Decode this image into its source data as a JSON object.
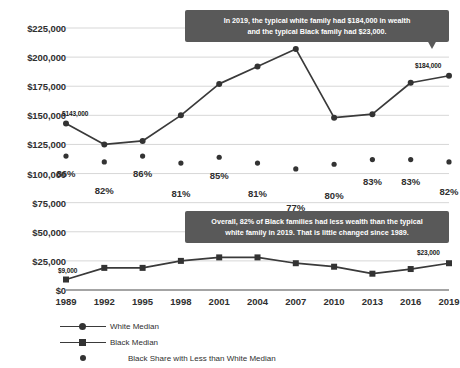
{
  "chart_data": {
    "type": "line",
    "title": "",
    "subtitle": "",
    "xlabel": "",
    "ylabel": "",
    "ylim": [
      0,
      225000
    ],
    "grid": true,
    "legend_position": "bottom-left",
    "categories": [
      "1989",
      "1992",
      "1995",
      "1998",
      "2001",
      "2004",
      "2007",
      "2010",
      "2013",
      "2016",
      "2019"
    ],
    "y_ticks": [
      "$0",
      "$25,000",
      "$50,000",
      "$75,000",
      "$100,000",
      "$125,000",
      "$150,000",
      "$175,000",
      "$200,000",
      "$225,000"
    ],
    "y_tick_values": [
      0,
      25000,
      50000,
      75000,
      100000,
      125000,
      150000,
      175000,
      200000,
      225000
    ],
    "series": [
      {
        "name": "White Median",
        "marker": "circle",
        "color": "#333333",
        "values": [
          143000,
          125000,
          128000,
          150000,
          177000,
          192000,
          207000,
          148000,
          151000,
          178000,
          184000
        ]
      },
      {
        "name": "Black Median",
        "marker": "square",
        "color": "#333333",
        "values": [
          9000,
          19000,
          19000,
          25000,
          28000,
          28000,
          23000,
          20000,
          14000,
          18000,
          23000
        ]
      },
      {
        "name": "Black Share with Less than White Median",
        "marker": "dot",
        "color": "#333333",
        "unit": "percent",
        "plotted_at": [
          115000,
          110000,
          115000,
          109000,
          114000,
          109000,
          104000,
          108000,
          112000,
          112000,
          110000
        ],
        "values": [
          86,
          82,
          86,
          81,
          85,
          81,
          77,
          80,
          83,
          83,
          82
        ],
        "labels": [
          "86%",
          "82%",
          "86%",
          "81%",
          "85%",
          "81%",
          "77%",
          "80%",
          "83%",
          "83%",
          "82%"
        ]
      }
    ],
    "point_labels": [
      {
        "series": "White Median",
        "category": "1989",
        "text": "$143,000"
      },
      {
        "series": "White Median",
        "category": "2019",
        "text": "$184,000"
      },
      {
        "series": "Black Median",
        "category": "1989",
        "text": "$9,000"
      },
      {
        "series": "Black Median",
        "category": "2019",
        "text": "$23,000"
      }
    ],
    "annotations": [
      {
        "id": "callout-top",
        "lines": [
          "In 2019, the typical white family had $184,000 in wealth",
          "and the typical Black family had $23,000."
        ],
        "has_tail": true,
        "background": "#595959",
        "text_color": "#ffffff"
      },
      {
        "id": "callout-bottom",
        "lines": [
          "Overall, 82% of Black families had less wealth than the typical",
          "white family in 2019. That is little changed since 1989."
        ],
        "has_tail": false,
        "background": "#595959",
        "text_color": "#ffffff"
      }
    ]
  },
  "colors": {
    "line": "#3a3a3a",
    "marker": "#333333",
    "grid": "#d2d2d2",
    "axis": "#4a4a4a",
    "callout_bg": "#595959",
    "text": "#2f2f2f",
    "background": "#ffffff"
  }
}
